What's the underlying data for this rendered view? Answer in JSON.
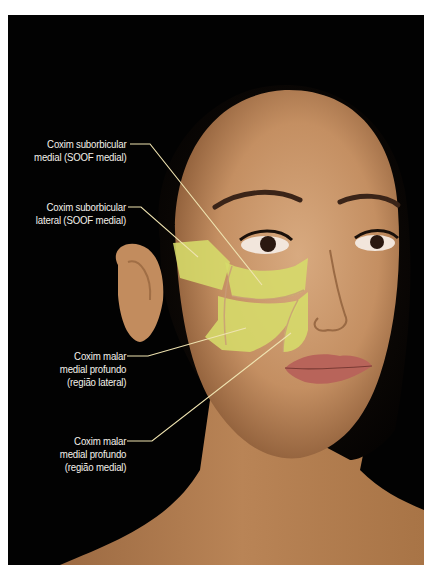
{
  "figure": {
    "colors": {
      "background": "#020202",
      "fat_pad_overlay": "#d6dc6a",
      "leader_line": "#efe3b0",
      "label_text": "#f4f1ea",
      "skin": "#c9976b"
    },
    "labels": [
      {
        "line1": "Coxim suborbicular",
        "line2": "medial (SOOF medial)"
      },
      {
        "line1": "Coxim suborbicular",
        "line2": "lateral (SOOF medial)"
      },
      {
        "line1": "Coxim malar",
        "line2": "medial profundo",
        "line3": "(região lateral)"
      },
      {
        "line1": "Coxim malar",
        "line2": "medial profundo",
        "line3": "(região medial)"
      }
    ]
  }
}
